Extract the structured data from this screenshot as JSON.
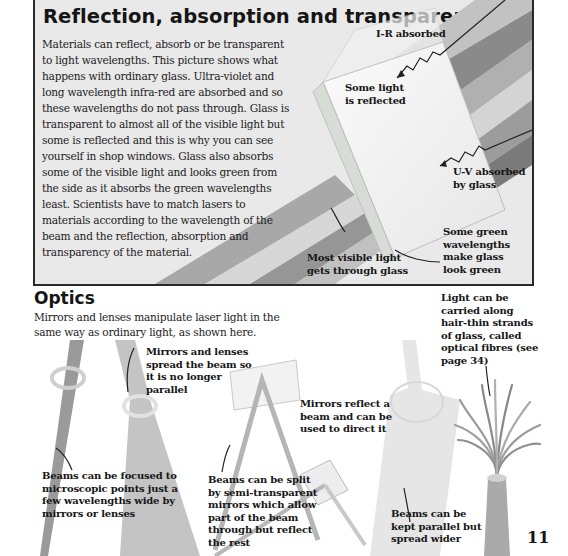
{
  "reflection_section": {
    "title": "Reflection, absorption and transparency",
    "body": "Materials can reflect, absorb or be transparent to light wavelengths. This picture shows what happens with ordinary glass. Ultra-violet and long wavelength infra-red are absorbed and so these wavelengths do not pass through. Glass is transparent to almost all of the visible light but some is reflected and this is why you can see yourself in shop windows. Glass also absorbs some of the visible light and looks green from the side as it absorbs the green wavelengths least. Scientists have to match lasers to materials according to the wavelength of the beam and the reflection, absorption and transparency of the material.",
    "labels": {
      "ir_absorbed": "I-R absorbed",
      "some_light_reflected": "Some light is reflected",
      "uv_absorbed": "U-V absorbed by glass",
      "most_visible_light": "Most visible light gets through glass",
      "green_wavelengths": "Some green wavelengths make glass look green"
    }
  },
  "optics_section": {
    "title": "Optics",
    "intro": "Mirrors and lenses manipulate laser light in the same way as ordinary light, as shown here.",
    "labels": {
      "lenses_spread": "Mirrors and lenses spread the beam so it is no longer parallel",
      "mirrors_reflect": "Mirrors reflect a beam and can be used to direct it",
      "optical_fibres": "Light can be carried along hair-thin strands of glass, called optical fibres (see page 34)",
      "beams_focused": "Beams can be focused to microscopic points just a few wavelengths wide by mirrors or lenses",
      "beams_split": "Beams can be split by semi-transparent mirrors which allow part of the beam through but reflect the rest",
      "beams_parallel": "Beams can be kept parallel but spread wider"
    }
  },
  "page_number": "11",
  "colors": {
    "box_background": "#e9e9e9",
    "box_border": "#2a2a2a",
    "text": "#1a1a1a",
    "beam_dark": "#7d7d7d",
    "beam_mid": "#a6a6a6",
    "beam_light": "#cfcfcf",
    "glass": "#f4f4f4"
  }
}
